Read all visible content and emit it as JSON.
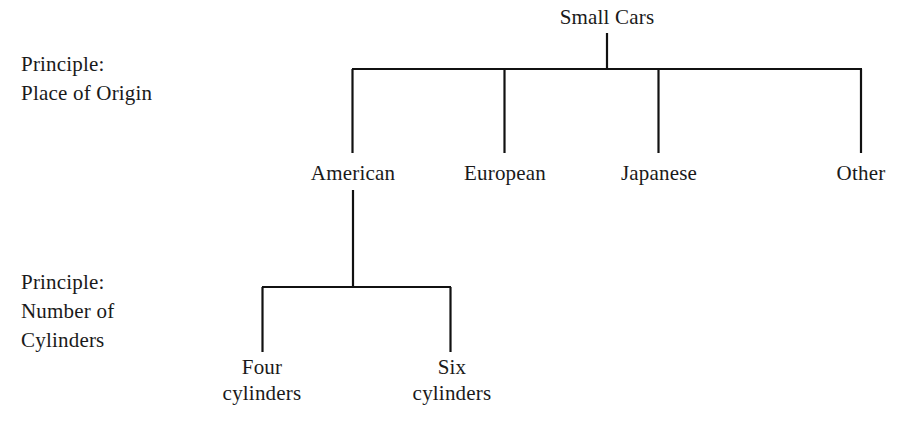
{
  "diagram": {
    "type": "hierarchy-tree",
    "line_color": "#111111",
    "text_color": "#1a1a1a",
    "background_color": "#ffffff"
  },
  "principles": {
    "origin": "Principle:\nPlace of Origin",
    "cylinders": "Principle:\nNumber of\nCylinders"
  },
  "nodes": {
    "root": "Small Cars",
    "american": "American",
    "european": "European",
    "japanese": "Japanese",
    "other": "Other",
    "four_cylinders": "Four\ncylinders",
    "six_cylinders": "Six\ncylinders"
  },
  "tree": {
    "root": {
      "label": "Small Cars",
      "level": 0,
      "children": [
        {
          "label": "American",
          "level": 1,
          "children": [
            {
              "label": "Four cylinders",
              "level": 2,
              "children": []
            },
            {
              "label": "Six cylinders",
              "level": 2,
              "children": []
            }
          ]
        },
        {
          "label": "European",
          "level": 1,
          "children": []
        },
        {
          "label": "Japanese",
          "level": 1,
          "children": []
        },
        {
          "label": "Other",
          "level": 1,
          "children": []
        }
      ]
    }
  }
}
